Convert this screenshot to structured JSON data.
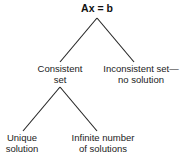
{
  "diagram": {
    "type": "tree",
    "root": {
      "label": "Ax = b"
    },
    "level1": [
      {
        "lines": [
          "Consistent",
          "set"
        ]
      },
      {
        "lines": [
          "Inconsistent set—",
          "no solution"
        ]
      }
    ],
    "level2": [
      {
        "parent": "Consistent set",
        "lines": [
          "Unique",
          "solution"
        ]
      },
      {
        "parent": "Consistent set",
        "lines": [
          "Infinite number",
          "of solutions"
        ]
      }
    ],
    "edges": [
      {
        "from": "Ax = b",
        "to": "Consistent set"
      },
      {
        "from": "Ax = b",
        "to": "Inconsistent set—no solution"
      },
      {
        "from": "Consistent set",
        "to": "Unique solution"
      },
      {
        "from": "Consistent set",
        "to": "Infinite number of solutions"
      }
    ],
    "line_color": "#222222"
  }
}
